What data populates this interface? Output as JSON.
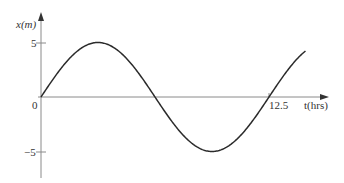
{
  "chart_data": {
    "type": "line",
    "title": "",
    "xlabel": "t(hrs)",
    "ylabel": "x(m)",
    "function": "x(t) = 5 sin(2*pi*t/12.5)",
    "amplitude": 5,
    "period": 12.5,
    "x_ticks": [
      {
        "value": 0,
        "label": "0"
      },
      {
        "value": 12.5,
        "label": "12.5"
      }
    ],
    "y_ticks": [
      {
        "value": 5,
        "label": "5"
      },
      {
        "value": -5,
        "label": "−5"
      }
    ],
    "xlim": [
      0,
      14.5
    ],
    "ylim": [
      -6.5,
      6
    ],
    "grid": false,
    "legend": null,
    "series": [
      {
        "name": "x(t)",
        "x": [
          0,
          1.5625,
          3.125,
          4.6875,
          6.25,
          7.8125,
          9.375,
          10.9375,
          12.5,
          14.0
        ],
        "values": [
          0,
          3.54,
          5,
          3.54,
          0,
          -3.54,
          -5,
          -3.54,
          0,
          3.68
        ]
      }
    ]
  },
  "labels": {
    "y_axis": "x(m)",
    "x_axis": "t(hrs)",
    "origin": "0",
    "tick_x_12_5": "12.5",
    "tick_y_pos5": "5",
    "tick_y_neg5": "−5"
  },
  "colors": {
    "axis": "#8a8a8a",
    "curve": "#2b2b2b",
    "text": "#333333"
  }
}
